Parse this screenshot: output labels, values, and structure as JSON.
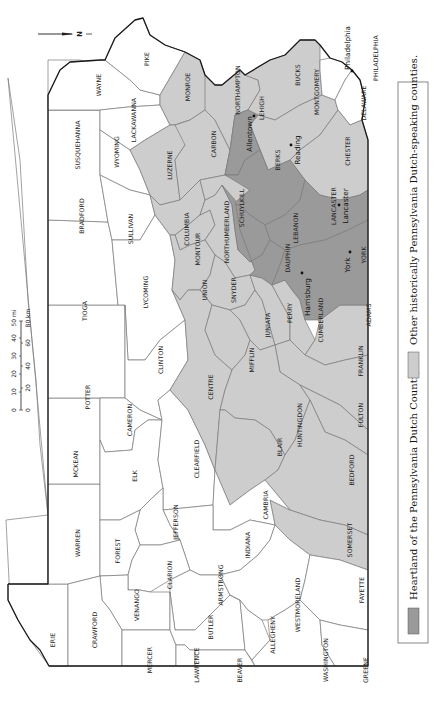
{
  "map": {
    "title": "Pennsylvania Dutch Country counties",
    "orientation": "rotated 90° (north points left)",
    "north_label": "N",
    "colors": {
      "heartland": "#9a9a9a",
      "other": "#cdcdcd",
      "none": "#ffffff",
      "border": "#1a1a1a"
    },
    "scale": {
      "miles_label": "50 mi",
      "km_label": "80 km",
      "miles_ticks": [
        "0",
        "10",
        "20",
        "30",
        "40"
      ],
      "km_ticks": [
        "0",
        "20",
        "40",
        "60"
      ]
    },
    "legend": {
      "heartland": "Heartland of the Pennsylvania Dutch Country",
      "other": "Other historically Pennsylvania Dutch-speaking counties."
    },
    "counties": {
      "erie": "ERIE",
      "crawford": "CRAWFORD",
      "mercer": "MERCER",
      "lawrence": "LAWRENCE",
      "beaver": "BEAVER",
      "warren": "WARREN",
      "venango": "VENANGO",
      "butler": "BUTLER",
      "allegheny": "ALLEGHENY",
      "washington": "WASHINGTON",
      "greene": "GREENE",
      "forest": "FOREST",
      "clarion": "CLARION",
      "armstrong": "ARMSTRONG",
      "westmoreland": "WESTMORELAND",
      "fayette": "FAYETTE",
      "mckean": "MCKEAN",
      "elk": "ELK",
      "jefferson": "JEFFERSON",
      "indiana": "INDIANA",
      "somerset": "SOMERSET",
      "potter": "POTTER",
      "cameron": "CAMERON",
      "clearfield": "CLEARFIELD",
      "cambria": "CAMBRIA",
      "blair": "BLAIR",
      "bedford": "BEDFORD",
      "tioga": "TIOGA",
      "clinton": "CLINTON",
      "centre": "CENTRE",
      "huntingdon": "HUNTINGDON",
      "fulton": "FULTON",
      "franklin": "FRANKLIN",
      "mifflin": "MIFFLIN",
      "juniata": "JUNIATA",
      "perry": "PERRY",
      "cumberland": "CUMBERLAND",
      "adams": "ADAMS",
      "bradford": "BRADFORD",
      "lycoming": "LYCOMING",
      "union": "UNION",
      "snyder": "SNYDER",
      "sullivan": "SULLIVAN",
      "columbia": "COLUMBIA",
      "montour": "MONTOUR",
      "northumberland": "NORTHUMBERLAND",
      "dauphin": "DAUPHIN",
      "york": "YORK",
      "lebanon": "LEBANON",
      "lancaster": "LANCASTER",
      "susquehanna": "SUSQUEHANNA",
      "wyoming": "WYOMING",
      "luzerne": "LUZERNE",
      "schuylkill": "SCHUYLKILL",
      "berks": "BERKS",
      "chester": "CHESTER",
      "wayne": "WAYNE",
      "lackawanna": "LACKAWANNA",
      "carbon": "CARBON",
      "lehigh": "LEHIGH",
      "pike": "PIKE",
      "monroe": "MONROE",
      "northampton": "NORTHAMPTON",
      "bucks": "BUCKS",
      "montgomery": "MONTGOMERY",
      "delaware": "DELAWARE",
      "philadelphia": "PHILADELPHIA"
    },
    "cities": {
      "allentown": "Allentown",
      "reading": "Reading",
      "lancaster": "Lancaster",
      "york": "York",
      "harrisburg": "Harrisburg",
      "philadelphia": "Philadelphia"
    }
  }
}
